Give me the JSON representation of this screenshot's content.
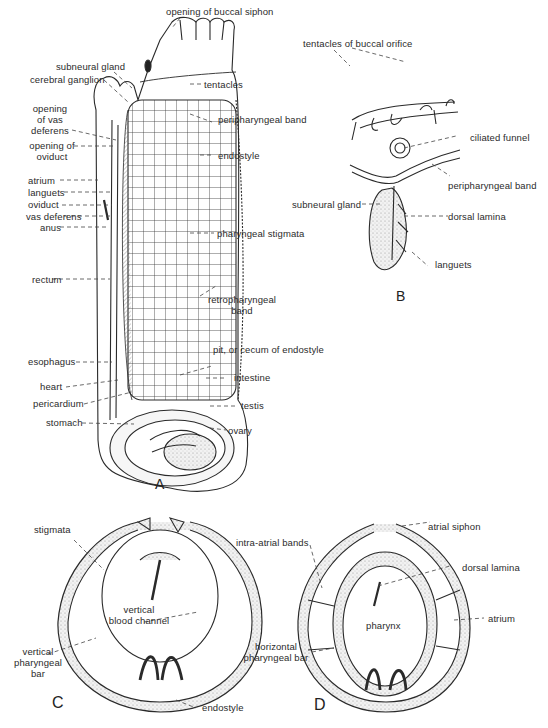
{
  "figure": {
    "panels": [
      {
        "id": "A",
        "letter": "A"
      },
      {
        "id": "B",
        "letter": "B"
      },
      {
        "id": "C",
        "letter": "C"
      },
      {
        "id": "D",
        "letter": "D"
      }
    ]
  },
  "panelA": {
    "labels": {
      "opening_buccal_siphon": "opening of buccal siphon",
      "subneural_gland": "subneural gland",
      "cerebral_ganglion": "cerebral ganglion",
      "tentacles": "tentacles",
      "opening_vas_deferens_1": "opening",
      "opening_vas_deferens_2": "of vas",
      "opening_vas_deferens_3": "deferens",
      "peripharyngeal_band": "peripharyngeal band",
      "opening_oviduct_1": "opening of",
      "opening_oviduct_2": "oviduct",
      "endostyle": "endostyle",
      "atrium": "atrium",
      "languets": "languets",
      "oviduct": "oviduct",
      "vas_deferens": "vas deferens",
      "anus": "anus",
      "pharyngeal_stigmata": "pharyngeal stigmata",
      "rectum": "rectum",
      "retropharyngeal_band_1": "retropharyngeal",
      "retropharyngeal_band_2": "band",
      "esophagus": "esophagus",
      "pit_cecum": "pit, or cecum of endostyle",
      "heart": "heart",
      "intestine": "intestine",
      "pericardium": "pericardium",
      "testis": "testis",
      "stomach": "stomach",
      "ovary": "ovary"
    }
  },
  "panelB": {
    "labels": {
      "tentacles_buccal_orifice": "tentacles of buccal orifice",
      "ciliated_funnel": "ciliated funnel",
      "peripharyngeal_band": "peripharyngeal band",
      "subneural_gland": "subneural gland",
      "dorsal_lamina": "dorsal lamina",
      "languets": "languets"
    }
  },
  "panelC": {
    "labels": {
      "stigmata": "stigmata",
      "vertical_blood_channel_1": "vertical",
      "vertical_blood_channel_2": "blood channel",
      "vertical_pharyngeal_bar_1": "vertical",
      "vertical_pharyngeal_bar_2": "pharyngeal",
      "vertical_pharyngeal_bar_3": "bar",
      "endostyle": "endostyle"
    }
  },
  "panelD": {
    "labels": {
      "atrial_siphon": "atrial siphon",
      "intra_atrial_bands": "intra-atrial bands",
      "dorsal_lamina": "dorsal lamina",
      "pharynx": "pharynx",
      "atrium": "atrium",
      "horizontal_pharyngeal_bar_1": "horizontal",
      "horizontal_pharyngeal_bar_2": "pharyngeal bar"
    }
  },
  "colors": {
    "ink": "#2a2a2a",
    "stipple": "#e4e4e4",
    "background": "#ffffff"
  }
}
